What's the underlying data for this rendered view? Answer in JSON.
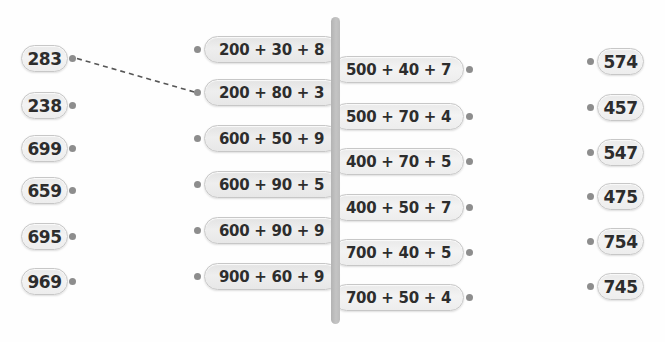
{
  "worksheet": {
    "type": "match-number-to-expanded-form",
    "columns": {
      "left": [
        "283",
        "238",
        "699",
        "659",
        "695",
        "969"
      ],
      "middle_left": [
        "200 + 30 + 8",
        "200 + 80 + 3",
        "600 + 50 + 9",
        "600 + 90 + 5",
        "600 + 90 + 9",
        "900 + 60 + 9"
      ],
      "middle_right": [
        "500 + 40 + 7",
        "500 + 70 + 4",
        "400 + 70 + 5",
        "400 + 50 + 7",
        "700 + 40 + 5",
        "700 + 50 + 4"
      ],
      "right": [
        "574",
        "457",
        "547",
        "475",
        "754",
        "745"
      ]
    },
    "example_connection": {
      "from": "283",
      "to": "200 + 80 + 3",
      "style": "dashed"
    },
    "colors": {
      "background": "#fefefe",
      "pill_fill": "#ededed",
      "pill_fill_dark": "#e6e6e6",
      "pill_border": "#c7c7c7",
      "text": "#2d2d2d",
      "dot": "#8d8d8d",
      "divider_bar": "#bcbcbc",
      "connector_line": "#565656"
    }
  }
}
